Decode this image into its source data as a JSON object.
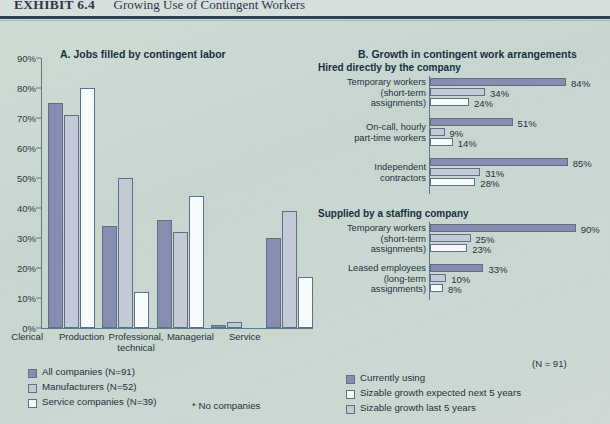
{
  "header": {
    "exhibit_label": "EXHIBIT 6.4",
    "exhibit_title": "Growing Use of Contingent Workers"
  },
  "panel_a": {
    "title": "A. Jobs filled by contingent labor"
  },
  "panel_b": {
    "title": "B. Growth in contingent work arrangements"
  },
  "legend_left": {
    "items": [
      {
        "label": "All companies (N=91)",
        "color": "#878db0"
      },
      {
        "label": "Manufacturers (N=52)",
        "color": "#c3cad5"
      },
      {
        "label": "Service companies (N=39)",
        "color": "#f7fafa"
      }
    ],
    "footnote": "* No companies"
  },
  "legend_right": {
    "note": "(N = 91)",
    "items": [
      {
        "label": "Currently using",
        "color": "#878db0"
      },
      {
        "label": "Sizable growth expected next 5 years",
        "color": "#f7fafa"
      },
      {
        "label": "Sizable growth last 5 years",
        "color": "#c3cad5"
      }
    ]
  },
  "sections": {
    "hired": "Hired directly by the company",
    "supplied": "Supplied by a staffing company"
  },
  "chart_data": [
    {
      "type": "bar",
      "id": "panel-a",
      "title": "A. Jobs filled by contingent labor",
      "orientation": "vertical",
      "xlabel": "",
      "ylabel": "",
      "ylim": [
        0,
        90
      ],
      "yticks": [
        "0%",
        "10%",
        "20%",
        "30%",
        "40%",
        "50%",
        "60%",
        "70%",
        "80%",
        "90%"
      ],
      "grid": false,
      "legend_position": "bottom-left",
      "categories": [
        "Clerical",
        "Production",
        "Professional, technical",
        "Managerial",
        "Service"
      ],
      "category_lines": [
        [
          "Clerical"
        ],
        [
          "Production"
        ],
        [
          "Professional,",
          "technical"
        ],
        [
          "Managerial"
        ],
        [
          "Service"
        ]
      ],
      "series": [
        {
          "name": "All companies (N=91)",
          "values": [
            75,
            34,
            36,
            1,
            30
          ]
        },
        {
          "name": "Manufacturers (N=52)",
          "values": [
            71,
            50,
            32,
            2,
            39
          ]
        },
        {
          "name": "Service companies (N=39)",
          "values": [
            80,
            12,
            44,
            null,
            17
          ]
        }
      ],
      "annotations": [
        "* No companies"
      ]
    },
    {
      "type": "bar",
      "id": "panel-b",
      "title": "B. Growth in contingent work arrangements",
      "orientation": "horizontal",
      "xlim": [
        0,
        100
      ],
      "grid": false,
      "legend_position": "bottom",
      "note": "(N = 91)",
      "groups": [
        {
          "section": "Hired directly by the company",
          "rows": [
            {
              "label_lines": [
                "Temporary workers",
                "(short-term",
                "assignments)"
              ],
              "bars": [
                {
                  "series": "Currently using",
                  "value": 84,
                  "label": "84%"
                },
                {
                  "series": "Sizable growth last 5 years",
                  "value": 34,
                  "label": "34%"
                },
                {
                  "series": "Sizable growth expected next 5 years",
                  "value": 24,
                  "label": "24%"
                }
              ]
            },
            {
              "label_lines": [
                "On-call, hourly",
                "part-time workers"
              ],
              "bars": [
                {
                  "series": "Currently using",
                  "value": 51,
                  "label": "51%"
                },
                {
                  "series": "Sizable growth last 5 years",
                  "value": 9,
                  "label": "9%"
                },
                {
                  "series": "Sizable growth expected next 5 years",
                  "value": 14,
                  "label": "14%"
                }
              ]
            },
            {
              "label_lines": [
                "Independent",
                "contractors"
              ],
              "bars": [
                {
                  "series": "Currently using",
                  "value": 85,
                  "label": "85%"
                },
                {
                  "series": "Sizable growth last 5 years",
                  "value": 31,
                  "label": "31%"
                },
                {
                  "series": "Sizable growth expected next 5 years",
                  "value": 28,
                  "label": "28%"
                }
              ]
            }
          ]
        },
        {
          "section": "Supplied by a staffing company",
          "rows": [
            {
              "label_lines": [
                "Temporary workers",
                "(short-term",
                "assignments)"
              ],
              "bars": [
                {
                  "series": "Currently using",
                  "value": 90,
                  "label": "90%"
                },
                {
                  "series": "Sizable growth last 5 years",
                  "value": 25,
                  "label": "25%"
                },
                {
                  "series": "Sizable growth expected next 5 years",
                  "value": 23,
                  "label": "23%"
                }
              ]
            },
            {
              "label_lines": [
                "Leased employees",
                "(long-term",
                "assignments)"
              ],
              "bars": [
                {
                  "series": "Currently using",
                  "value": 33,
                  "label": "33%"
                },
                {
                  "series": "Sizable growth last 5 years",
                  "value": 10,
                  "label": "10%"
                },
                {
                  "series": "Sizable growth expected next 5 years",
                  "value": 8,
                  "label": "8%"
                }
              ]
            }
          ]
        }
      ]
    }
  ]
}
